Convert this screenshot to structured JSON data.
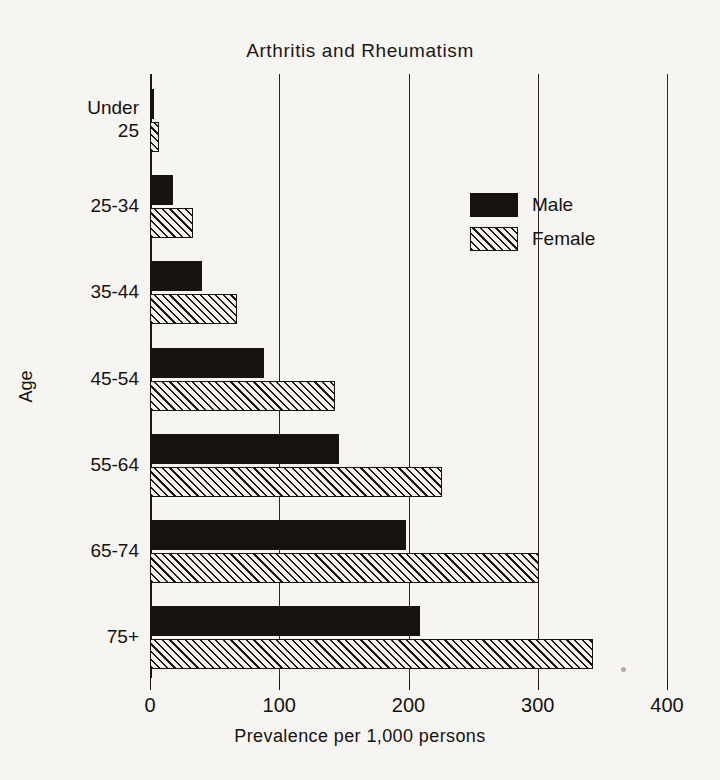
{
  "chart_data": {
    "type": "bar",
    "orientation": "horizontal",
    "title": "Arthritis and Rheumatism",
    "xlabel": "Prevalence per 1,000 persons",
    "ylabel": "Age",
    "categories": [
      "Under\n25",
      "25-34",
      "35-44",
      "45-54",
      "55-64",
      "65-74",
      "75+"
    ],
    "xticks": [
      0,
      100,
      200,
      300,
      400
    ],
    "xticklabels": [
      "0",
      "100",
      "200",
      "300",
      "400"
    ],
    "xlim": [
      0,
      400
    ],
    "grid": "vertical",
    "legend_position": "upper-right-inside",
    "series": [
      {
        "name": "Male",
        "fill": "solid-black",
        "color": "#16130f",
        "values": [
          3,
          18,
          40,
          88,
          146,
          198,
          209
        ]
      },
      {
        "name": "Female",
        "fill": "diagonal-hatch",
        "color": "#1b1714",
        "values": [
          7,
          33,
          67,
          143,
          226,
          301,
          343
        ]
      }
    ]
  },
  "legend": {
    "items": [
      {
        "label": "Male",
        "fill": "solid-black"
      },
      {
        "label": "Female",
        "fill": "diagonal-hatch"
      }
    ]
  },
  "colors": {
    "background": "#f6f5f2",
    "ink": "#15120f",
    "male_fill": "#16130f",
    "female_hatch": "#1b1714"
  }
}
